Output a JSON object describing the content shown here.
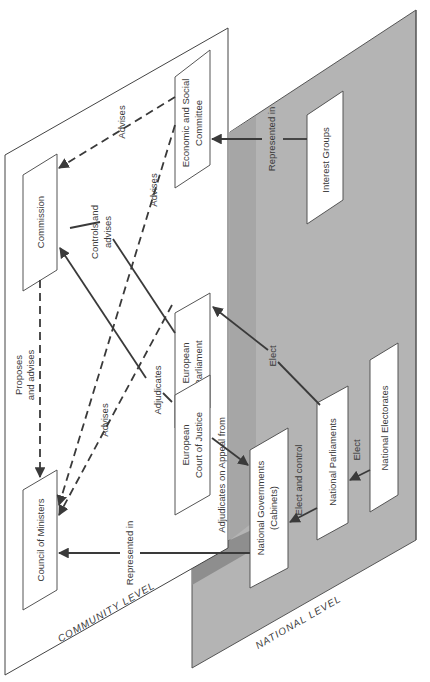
{
  "diagram": {
    "levels": {
      "community": "COMMUNITY LEVEL",
      "national": "NATIONAL LEVEL"
    },
    "nodes": {
      "commission": [
        "Commission"
      ],
      "council": [
        "Council of Ministers"
      ],
      "parliament": [
        "European",
        "Parliament"
      ],
      "court": [
        "European",
        "Court of Justice"
      ],
      "esc": [
        "Economic and Social",
        "Committee"
      ],
      "interest_groups": [
        "Interest Groups"
      ],
      "national_governments": [
        "National Governments",
        "(Cabinets)"
      ],
      "national_parliaments": [
        "National Parliaments"
      ],
      "national_electorates": [
        "National Electorates"
      ]
    },
    "edges": {
      "esc_commission": "Advises",
      "esc_council": "Advises",
      "parliament_commission": [
        "Controls and",
        "advises"
      ],
      "parliament_council": "Advises",
      "commission_council": [
        "Proposes",
        "and advises"
      ],
      "court_commission": "Adjudicates",
      "court_natgov": "Adjudicates on Appeal from",
      "natgov_council": "Represented in",
      "interest_esc": "Represented in",
      "natparl_parliament": "Elect",
      "natparl_natgov": "Elect and control",
      "electorate_natparl": "Elect"
    },
    "colors": {
      "community_plane": "#ffffff",
      "national_plane": "#b4b4b4",
      "national_shadow": "#9a9a9a",
      "line": "#3a3a3a"
    }
  }
}
